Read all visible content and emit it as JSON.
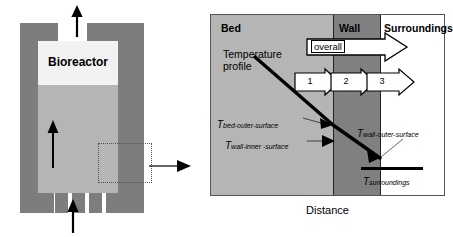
{
  "figure": {
    "left_panel": {
      "title": "Bioreactor",
      "inlet_arrow": "up-arrow-inlet",
      "outlet_arrow": "up-arrow-outlet",
      "internal_flow_arrow": "up-arrow-internal-flow",
      "callout_arrow": "right-arrow-callout",
      "leg_count": 5
    },
    "right_panel": {
      "zones": [
        {
          "key": "bed",
          "label": "Bed",
          "color": "#b5b5b5"
        },
        {
          "key": "wall",
          "label": "Wall",
          "color": "#808080"
        },
        {
          "key": "surroundings",
          "label": "Surroundings",
          "color": "#ffffff"
        }
      ],
      "profile_label_line1": "Temperature",
      "profile_label_line2": "profile",
      "overall_arrow_label": "overall",
      "resistance_arrows": [
        {
          "number": "1"
        },
        {
          "number": "2"
        },
        {
          "number": "3"
        }
      ],
      "temperatures": [
        {
          "symbol": "T",
          "subscript": "bed-outer-surface"
        },
        {
          "symbol": "T",
          "subscript": "wall-inner -surface"
        },
        {
          "symbol": "T",
          "subscript": "wall-outer-surface"
        },
        {
          "symbol": "T",
          "subscript": "surroundings"
        }
      ],
      "x_axis_label": "Distance"
    }
  }
}
